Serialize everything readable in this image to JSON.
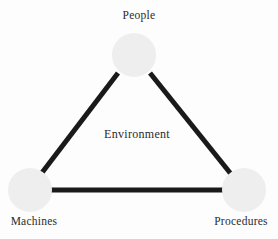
{
  "diagram": {
    "type": "triangle-relationship-diagram",
    "center_label": "Environment",
    "background_color": "#fdfdfd",
    "node_fill_color": "#eeeeee",
    "edge_color": "#1a1a1a",
    "text_color": "#2b2b2b",
    "nodes": [
      {
        "id": "people",
        "label": "People",
        "cx": 134,
        "cy": 55,
        "r": 22,
        "label_position": "above"
      },
      {
        "id": "machines",
        "label": "Machines",
        "cx": 30,
        "cy": 190,
        "r": 22,
        "label_position": "below"
      },
      {
        "id": "procedures",
        "label": "Procedures",
        "cx": 244,
        "cy": 190,
        "r": 22,
        "label_position": "below"
      }
    ],
    "edges": [
      {
        "id": "people-machines",
        "from": "people",
        "to": "machines",
        "width": 5
      },
      {
        "id": "people-procedures",
        "from": "people",
        "to": "procedures",
        "width": 5
      },
      {
        "id": "machines-procedures",
        "from": "machines",
        "to": "procedures",
        "width": 5
      }
    ]
  }
}
